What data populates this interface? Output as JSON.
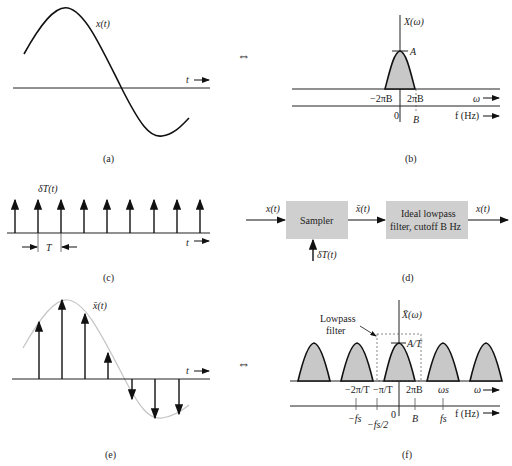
{
  "panels": {
    "a": {
      "caption": "(a)",
      "signal_label": "x(t)",
      "axis_label": "t"
    },
    "b": {
      "caption": "(b)",
      "title": "X(ω)",
      "peak_label": "A",
      "ticks_omega": [
        "−2πB",
        "2πB"
      ],
      "omega_label": "ω",
      "ticks_f": [
        "0",
        "B"
      ],
      "f_label": "f (Hz)"
    },
    "c": {
      "caption": "(c)",
      "signal_label": "δT(t)",
      "period_label": "T",
      "axis_label": "t",
      "impulse_count": 9
    },
    "d": {
      "caption": "(d)",
      "input_label": "x(t)",
      "sampler_label": "Sampler",
      "mid_label": "x̄(t)",
      "filter_line1": "Ideal lowpass",
      "filter_line2": "filter, cutoff B Hz",
      "output_label": "x(t)",
      "impulse_input_label": "δT(t)"
    },
    "e": {
      "caption": "(e)",
      "signal_label": "x̄(t)",
      "axis_label": "t"
    },
    "f": {
      "caption": "(f)",
      "title": "X̄(ω)",
      "filter_label_1": "Lowpass",
      "filter_label_2": "filter",
      "peak_label": "A/T",
      "ticks_omega": [
        "−2π/T",
        "−π/T",
        "2πB",
        "ωs"
      ],
      "omega_label": "ω",
      "ticks_f": [
        "−fs",
        "−fs/2",
        "0",
        "B",
        "fs"
      ],
      "f_label": "f (Hz)"
    }
  },
  "equivalence_symbol": "⇔"
}
